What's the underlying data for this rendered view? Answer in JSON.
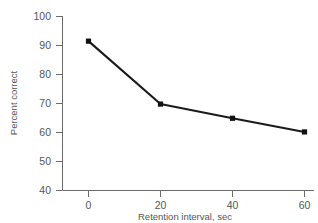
{
  "chart_data": {
    "type": "line",
    "title": "",
    "xlabel": "Retention interval, sec",
    "ylabel": "Percent correct",
    "x": [
      0,
      20,
      40,
      60
    ],
    "values": [
      91.5,
      69.8,
      64.9,
      60.2
    ],
    "series": [
      {
        "name": "Percent correct",
        "values": [
          91.5,
          69.8,
          64.9,
          60.2
        ]
      }
    ],
    "xlim": [
      -5,
      62
    ],
    "ylim": [
      40,
      100
    ],
    "xticks": [
      0,
      20,
      40,
      60
    ],
    "yticks": [
      40,
      50,
      60,
      70,
      80,
      90,
      100
    ],
    "xtick_labels": [
      "0",
      "20",
      "40",
      "60"
    ],
    "ytick_labels": [
      "40",
      "50",
      "60",
      "70",
      "80",
      "90",
      "100"
    ],
    "grid": false,
    "legend": null,
    "marker": "filled-square",
    "line_color": "#1a1a1a",
    "axis_color": "#6b6b6b",
    "background": "#ffffff"
  },
  "axes": {
    "y_title": "Percent correct",
    "x_title": "Retention interval, sec",
    "y_labels": {
      "t100": "100",
      "t90": "90",
      "t80": "80",
      "t70": "70",
      "t60": "60",
      "t50": "50",
      "t40": "40"
    },
    "x_labels": {
      "t0": "0",
      "t20": "20",
      "t40": "40",
      "t60": "60"
    }
  }
}
